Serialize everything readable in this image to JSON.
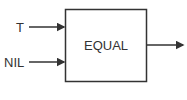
{
  "diagram": {
    "block": {
      "label": "EQUAL"
    },
    "inputs": [
      {
        "label": "T"
      },
      {
        "label": "NIL"
      }
    ],
    "output": {
      "label": ""
    },
    "colors": {
      "stroke": "#333333",
      "background": "#ffffff"
    }
  }
}
